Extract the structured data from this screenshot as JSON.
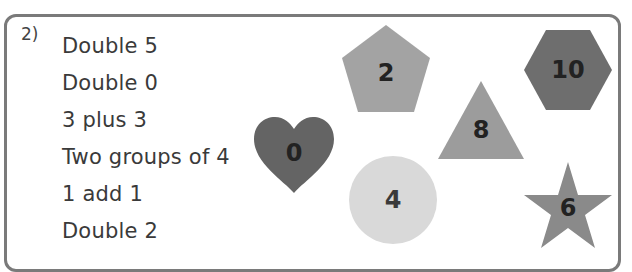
{
  "question": {
    "number": "2)",
    "items": [
      "Double 5",
      "Double 0",
      "3 plus 3",
      "Two groups of 4",
      "1 add 1",
      "Double 2"
    ]
  },
  "shapes": [
    {
      "shape": "pentagon",
      "value": "2",
      "color": "#a3a3a3"
    },
    {
      "shape": "hexagon",
      "value": "10",
      "color": "#6e6e6e"
    },
    {
      "shape": "triangle",
      "value": "8",
      "color": "#9c9c9c"
    },
    {
      "shape": "heart",
      "value": "0",
      "color": "#646464"
    },
    {
      "shape": "circle",
      "value": "4",
      "color": "#d9d9d9"
    },
    {
      "shape": "star",
      "value": "6",
      "color": "#8a8a8a"
    }
  ]
}
